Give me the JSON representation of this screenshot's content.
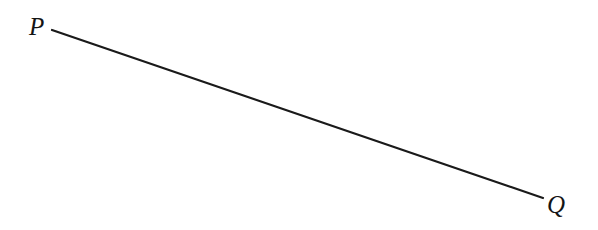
{
  "figure": {
    "type": "geometry-diagram",
    "canvas": {
      "width": 598,
      "height": 230
    },
    "background_color": "#ffffff",
    "stroke_color": "#1a1a1a",
    "label_color": "#141414",
    "stroke_width": 2.2,
    "segment": {
      "name": "PQ",
      "start": {
        "label": "P",
        "x": 52,
        "y": 30
      },
      "end": {
        "label": "Q",
        "x": 543,
        "y": 198
      }
    },
    "labels": {
      "p": "P",
      "q": "Q"
    }
  }
}
